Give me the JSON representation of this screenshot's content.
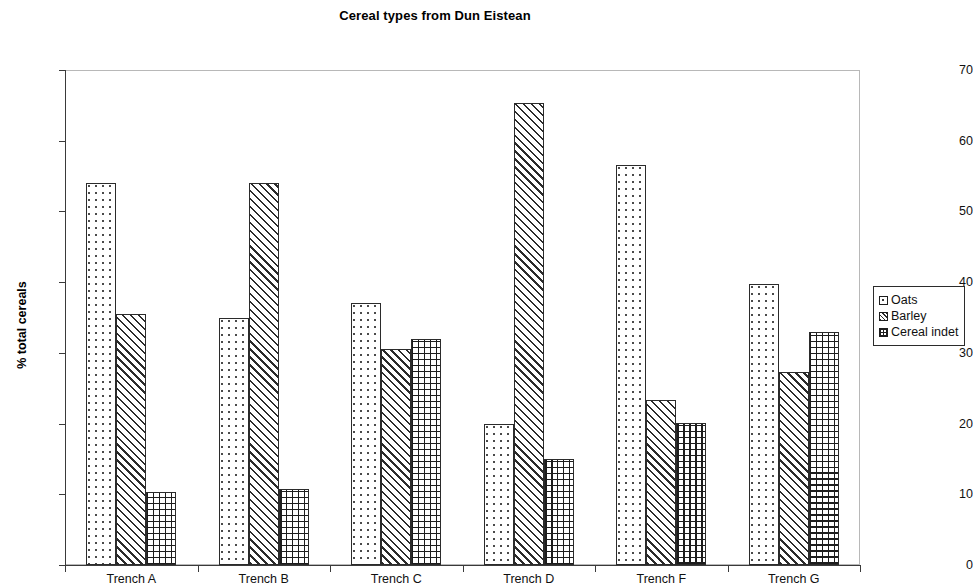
{
  "chart_data": {
    "type": "bar",
    "title": "Cereal types from Dun Eistean",
    "xlabel": "",
    "ylabel": "% total cereals",
    "ylim": [
      0,
      70
    ],
    "ytick_step": 10,
    "yticks": [
      0,
      10,
      20,
      30,
      40,
      50,
      60,
      70
    ],
    "grid": false,
    "legend_position": "right",
    "categories": [
      "Trench A",
      "Trench B",
      "Trench C",
      "Trench D",
      "Trench F",
      "Trench G"
    ],
    "series": [
      {
        "name": "Oats",
        "pattern": "dotted",
        "values": [
          54.0,
          35.0,
          37.0,
          20.0,
          56.5,
          39.7
        ]
      },
      {
        "name": "Barley",
        "pattern": "diagonal",
        "values": [
          35.5,
          54.0,
          30.5,
          65.3,
          23.3,
          27.3
        ]
      },
      {
        "name": "Cereal indet",
        "pattern": "crosshatch",
        "values": [
          10.3,
          10.8,
          32.0,
          15.0,
          20.1,
          33.0
        ]
      }
    ]
  },
  "legend": {
    "items": [
      {
        "label": "Oats"
      },
      {
        "label": "Barley"
      },
      {
        "label": "Cereal indet"
      }
    ]
  }
}
